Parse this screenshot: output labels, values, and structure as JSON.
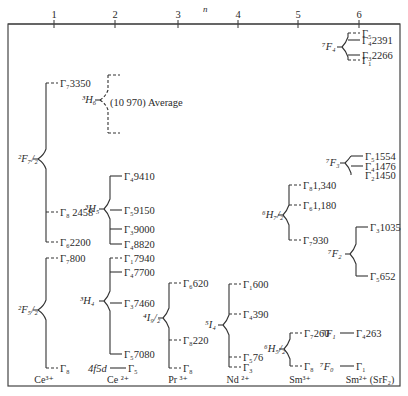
{
  "axis": {
    "label": "n",
    "ticks": [
      {
        "value": "1",
        "x": 54
      },
      {
        "value": "2",
        "x": 115
      },
      {
        "value": "3",
        "x": 178
      },
      {
        "value": "4",
        "x": 238
      },
      {
        "value": "5",
        "x": 298
      },
      {
        "value": "6",
        "x": 359
      }
    ]
  },
  "ions": [
    {
      "label": "Ce³⁺",
      "x": 44
    },
    {
      "label": "Ce ²⁺",
      "x": 118
    },
    {
      "label": "Pr ³⁺",
      "x": 178
    },
    {
      "label": "Nd ²⁺",
      "x": 238
    },
    {
      "label": "Sm³⁺",
      "x": 300
    },
    {
      "label": "Sm²⁺ (SrF₂)",
      "x": 370
    }
  ],
  "groups": [
    {
      "id": "ce3-2F7/2",
      "term": "²F₇/₂",
      "termX": 18,
      "termY": 162,
      "stemX": 38,
      "branchX": 46,
      "stemTop": 83,
      "stemBottom": 242,
      "levels": [
        {
          "y": 83,
          "label": "Γ₇3350",
          "dashed": true
        },
        {
          "y": 212,
          "label": "Γ₈ 2458",
          "dashed": true
        },
        {
          "y": 242,
          "label": "Γ₆2200",
          "dashed": true
        }
      ]
    },
    {
      "id": "ce3-2F5/2",
      "term": "²F₅/₂",
      "termX": 18,
      "termY": 313,
      "stemX": 38,
      "branchX": 46,
      "stemTop": 258,
      "stemBottom": 368,
      "levels": [
        {
          "y": 258,
          "label": "Γ₇800",
          "dashed": true
        },
        {
          "y": 368,
          "label": "Γ₈",
          "dashed": true
        }
      ]
    },
    {
      "id": "ce2-3H6",
      "term": "³H₆",
      "termX": 82,
      "termY": 103,
      "stemX": 100,
      "branchX": 108,
      "stemTop": 75,
      "stemBottom": 133,
      "levels": [
        {
          "y": 75,
          "label": "",
          "dashed": true
        },
        {
          "y": 133,
          "label": "",
          "dashed": true
        }
      ],
      "annotation": {
        "text": "(10 970) Average",
        "x": 110,
        "y": 106
      }
    },
    {
      "id": "ce2-3H5",
      "term": "³H₅",
      "termX": 85,
      "termY": 212,
      "stemX": 104,
      "branchX": 110,
      "stemTop": 176,
      "stemBottom": 244,
      "levels": [
        {
          "y": 176,
          "label": "Γ₄9410",
          "dashed": false
        },
        {
          "y": 210,
          "label": "Γ₅9150",
          "dashed": false
        },
        {
          "y": 229,
          "label": "Γ₃9000",
          "dashed": false
        },
        {
          "y": 244,
          "label": "Γ₄8820",
          "dashed": false
        }
      ]
    },
    {
      "id": "ce2-3H4",
      "term": "³H₄",
      "termX": 80,
      "termY": 304,
      "stemX": 104,
      "branchX": 110,
      "stemTop": 258,
      "stemBottom": 354,
      "levels": [
        {
          "y": 258,
          "label": "Γ₁7940",
          "dashed": true
        },
        {
          "y": 272,
          "label": "Γ₄7700",
          "dashed": false
        },
        {
          "y": 303,
          "label": "Γ₃7460",
          "dashed": false
        },
        {
          "y": 354,
          "label": "Γ₅7080",
          "dashed": false
        }
      ]
    },
    {
      "id": "ce2-4f5d",
      "term": "4f5d",
      "termX": 88,
      "termY": 372,
      "stemX": null,
      "levels": [
        {
          "y": 368,
          "label": "Γ₅",
          "dashed": false,
          "x1": 110,
          "x2": 126
        }
      ]
    },
    {
      "id": "pr3-4I9/2",
      "term": "⁴I₉/₂",
      "termX": 143,
      "termY": 321,
      "stemX": 163,
      "branchX": 169,
      "stemTop": 283,
      "stemBottom": 368,
      "levels": [
        {
          "y": 283,
          "label": "Γ₆620",
          "dashed": true
        },
        {
          "y": 340,
          "label": "Γ₈220",
          "dashed": true
        },
        {
          "y": 368,
          "label": "Γ₈",
          "dashed": true
        }
      ]
    },
    {
      "id": "nd2-5I4",
      "term": "⁵I₄",
      "termX": 205,
      "termY": 328,
      "stemX": 223,
      "branchX": 229,
      "stemTop": 284,
      "stemBottom": 367,
      "levels": [
        {
          "y": 284,
          "label": "Γ₁600",
          "dashed": true
        },
        {
          "y": 314,
          "label": "Γ₄390",
          "dashed": true
        },
        {
          "y": 357,
          "label": "Γ₅76",
          "dashed": true
        },
        {
          "y": 367,
          "label": "Γ₃",
          "dashed": true
        }
      ]
    },
    {
      "id": "sm3-6H7/2",
      "term": "⁶H₇/₂",
      "termX": 262,
      "termY": 218,
      "stemX": 283,
      "branchX": 289,
      "stemTop": 185,
      "stemBottom": 240,
      "levels": [
        {
          "y": 185,
          "label": "Γ₈1,340",
          "dashed": true
        },
        {
          "y": 205,
          "label": "Γ₆1,180",
          "dashed": true
        },
        {
          "y": 240,
          "label": "Γ₇930",
          "dashed": true
        }
      ]
    },
    {
      "id": "sm3-6H5/2",
      "term": "⁶H₅/₂",
      "termX": 264,
      "termY": 352,
      "stemX": 284,
      "branchX": 290,
      "stemTop": 333,
      "stemBottom": 366,
      "levels": [
        {
          "y": 333,
          "label": "Γ₇260",
          "dashed": true
        },
        {
          "y": 366,
          "label": "Γ₈",
          "dashed": true
        }
      ]
    },
    {
      "id": "sm2-7F4",
      "term": "⁷F₄",
      "termX": 322,
      "termY": 50,
      "stemX": 342,
      "branchX": 348,
      "stemTop": 33,
      "stemBottom": 60,
      "levels": [
        {
          "y": 33,
          "label": "Γ₅",
          "dashed": true
        },
        {
          "y": 40,
          "label": "Γ₄2391",
          "dashed": false
        },
        {
          "y": 55,
          "label": "Γ₃2266",
          "dashed": false
        },
        {
          "y": 60,
          "label": "Γ₁",
          "dashed": true
        }
      ]
    },
    {
      "id": "sm2-7F3",
      "term": "⁷F₃",
      "termX": 326,
      "termY": 166,
      "stemX": 345,
      "branchX": 351,
      "stemTop": 156,
      "stemBottom": 170,
      "levels": [
        {
          "y": 156,
          "label": "Γ₅1554",
          "dashed": false
        },
        {
          "y": 166,
          "label": "Γ₄1476",
          "dashed": false
        },
        {
          "y": 175,
          "label": "Γ₂1450",
          "dashed": false,
          "nolineLabelOnly": false
        }
      ]
    },
    {
      "id": "sm2-7F2",
      "term": "⁷F₂",
      "termX": 328,
      "termY": 257,
      "stemX": 350,
      "branchX": 356,
      "stemTop": 227,
      "stemBottom": 276,
      "levels": [
        {
          "y": 227,
          "label": "Γ₃1035",
          "dashed": false
        },
        {
          "y": 276,
          "label": "Γ₅652",
          "dashed": false
        }
      ]
    },
    {
      "id": "sm2-7F1",
      "term": "⁷F₁",
      "termX": 322,
      "termY": 337,
      "stemX": null,
      "levels": [
        {
          "y": 333,
          "label": "Γ₄263",
          "dashed": false,
          "x1": 340,
          "x2": 354
        }
      ]
    },
    {
      "id": "sm2-7F0",
      "term": "⁷F₀",
      "termX": 320,
      "termY": 370,
      "stemX": null,
      "levels": [
        {
          "y": 366,
          "label": "Γ₁",
          "dashed": false,
          "x1": 340,
          "x2": 354
        }
      ]
    }
  ]
}
